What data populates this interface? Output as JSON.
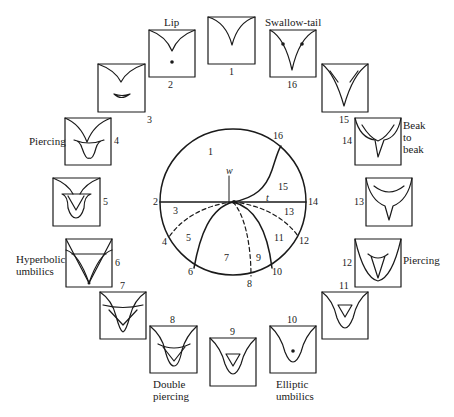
{
  "diagram": {
    "type": "bifurcation-set-with-caustic-panels",
    "center_disc": {
      "origin_label": "w",
      "axis_label": "t",
      "region_labels": [
        "1",
        "3",
        "5",
        "7",
        "9",
        "11",
        "13",
        "15"
      ],
      "boundary_labels": [
        "2",
        "4",
        "6",
        "8",
        "10",
        "12",
        "14",
        "16"
      ]
    },
    "panels": [
      {
        "id": "1",
        "number": "1",
        "name": ""
      },
      {
        "id": "2",
        "number": "2",
        "name": "Lip"
      },
      {
        "id": "3",
        "number": "3",
        "name": ""
      },
      {
        "id": "4",
        "number": "4",
        "name": "Piercing"
      },
      {
        "id": "5",
        "number": "5",
        "name": ""
      },
      {
        "id": "6",
        "number": "6",
        "name_line1": "Hyperbolic",
        "name_line2": "umbilics"
      },
      {
        "id": "7",
        "number": "7",
        "name": ""
      },
      {
        "id": "8",
        "number": "8",
        "name_line1": "Double",
        "name_line2": "piercing"
      },
      {
        "id": "9",
        "number": "9",
        "name": ""
      },
      {
        "id": "10",
        "number": "10",
        "name_line1": "Elliptic",
        "name_line2": "umbilics"
      },
      {
        "id": "11",
        "number": "11",
        "name": ""
      },
      {
        "id": "12",
        "number": "12",
        "name": "Piercing"
      },
      {
        "id": "13",
        "number": "13",
        "name": ""
      },
      {
        "id": "14",
        "number": "14",
        "name_line1": "Beak",
        "name_line2": "to",
        "name_line3": "beak"
      },
      {
        "id": "15",
        "number": "15",
        "name": ""
      },
      {
        "id": "16",
        "number": "16",
        "name": "Swallow-tail"
      }
    ]
  }
}
